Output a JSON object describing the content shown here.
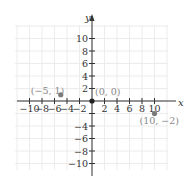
{
  "chart_data": {
    "type": "scatter",
    "title": "",
    "xlabel": "x",
    "ylabel": "y",
    "xlim": [
      -12,
      12
    ],
    "ylim": [
      -11,
      12
    ],
    "grid": true,
    "x_ticks": [
      -10,
      -8,
      -6,
      -4,
      -2,
      2,
      4,
      6,
      8,
      10
    ],
    "x_tick_labels": [
      "−10",
      "−8",
      "−6",
      "−4",
      "−2",
      "2",
      "4",
      "6",
      "8",
      "10"
    ],
    "y_ticks": [
      10,
      8,
      6,
      4,
      2,
      -2,
      -4,
      -6,
      -8,
      -10
    ],
    "y_tick_labels": [
      "10",
      "8",
      "6",
      "4",
      "2",
      "",
      "−4",
      "−6",
      "−8",
      "−10"
    ],
    "points": [
      {
        "x": -5,
        "y": 1,
        "label": "(−5, 1)",
        "color": "#7a7a7a"
      },
      {
        "x": 0,
        "y": 0,
        "label": "(0, 0)",
        "color": "#222222"
      },
      {
        "x": 10,
        "y": -2,
        "label": "(10, −2)",
        "color": "#7a7a7a"
      }
    ]
  },
  "colors": {
    "axis": "#333333",
    "grid": "#ececec",
    "tick_label": "#333333",
    "point_label": "#888888"
  }
}
